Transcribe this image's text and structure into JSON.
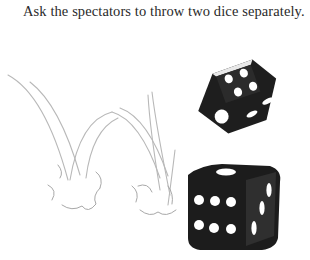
{
  "caption": "Ask the spectators to throw two dice separately.",
  "illustration": {
    "description": "Two black dice with white pips being thrown, pencil motion trails and bounce marks",
    "die_top": {
      "faces_visible": [
        1,
        4,
        2
      ],
      "color": "#1e1e1e",
      "pip_color": "#ffffff"
    },
    "die_bottom": {
      "faces_visible": [
        6,
        1,
        3
      ],
      "color": "#1e1e1e",
      "pip_color": "#ffffff"
    },
    "sketch_color": "#b5b5b5"
  }
}
